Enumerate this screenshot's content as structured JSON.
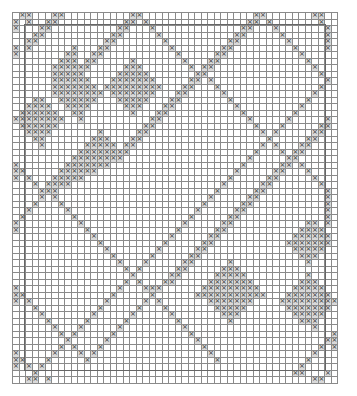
{
  "chart_data": {
    "type": "table",
    "title": "",
    "cols": 50,
    "rows_count": 57,
    "legend": {
      "x": "stitch (contrast color)",
      ".": "background"
    },
    "rows": [
      ".xx...xx..........xx.................xx.......xx..",
      "x.x..xx..........xx.x...............xx.x.......x.",
      "x...xx..........xx...x.............xx...x.......x",
      "...xx..........xx.....x...........xx.....x......x",
      "..xx..........xx.......x.........xx.......x.....x",
      "x.x......x...xx.........x.......xx.........x....x",
      "x.......xx..xx...........x.....xx...........x....",
      ".......xxx.xx.....x.......x...xx.............x...",
      "......xxxxxx.....xxx.......x.xx...............x..",
      "......xxxxx.....xxxxx.......xx.................x.",
      "......xxxxxx...xxxxxxx.....xx.x.................x",
      "......xxxxxxx.xxxxxxxxx...xx...x...............x.",
      "......xxxxxxxx.xxxxxxx...xx.....x.............x..",
      "...xx..xxxxxx...xxxxx...xx.......x...........x...",
      "..xxxx..xxxx.....xxx...xx.........x.........x....",
      ".xxxxxx..xx.......x...xx...........x.......x.....",
      "xxxxxxxx..x..........xx.............x.....x.....x",
      ".xxxxxx.............xx...............x...x.....xx",
      "..xxxx.......x.....xx.................x.x.....xx.",
      "...xx.......xxx...xx...................x.....xx..",
      "....x......xxxxx.xx...................x.x...xx...",
      "..........xxxxxxxx...................x...x.xx....",
      ".........xxxxxxxx...................x.....xx.....",
      "x.......xxxxxxx....................x.....xx.x....",
      "xx.....xxxxxx.....................x.....xx...x...",
      "x.x...xxxxx......................x.....xx.....x..",
      "...x.xxxx.......................x.....xx.......x.",
      "....xxx........................x.....xx.........x",
      "....x.x.......................x.....xx..........x",
      "...x...x.....................x.....xx...........x",
      "..x.....x...................x.....xx............x",
      ".x.......x.................x.....xx.............x",
      "x.........x...............x.....xx...........xx.x",
      "x..........x.............x.....xx...........xxxx.",
      "............x...........x.....xx...........xxxxxx",
      ".............x.........x.....xx...........xxxxxxx.",
      "..............x.......x.....xx.............xxxxx..",
      "...............x.....x.....xx...............xxx...",
      "................x...x.....xx.....x...........x....",
      ".................x.x.....xx.....xxx...............",
      "..................x.....xx.....xxxxx.........x....",
      ".................x.x...xx.....xxxxxxx.......xxx...",
      "x...............x...xxx......xxxxxxxxx.....xxxxx..",
      "xx.............x.....x......xxxxxxxxxxx...xxxxxxx.",
      "x.x...........x.....x.x.......xxxxxxx....xxxxxxxxx",
      "...x.........x.....x...x.......xxxxx......xxxxxxx.",
      "....x.......x.....x.....x.......xxx........xxxxx..",
      ".....x.....x.....x.......x.......x..........xxx...",
      "......x...x.....x.........x...................x...",
      ".......x.x.....x...........x.....................x",
      "........x.....x.............x...................xx",
      ".......x.x...x...............x.................x.x",
      "x.....x...x.x.................x...............x...",
      "xx...x.....x...................x.............x....",
      "x.x.x.......................................x.....",
      "...x.......................................xx...x.",
      "..xx.x........................................xx."
    ]
  }
}
